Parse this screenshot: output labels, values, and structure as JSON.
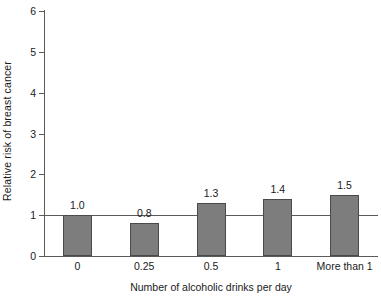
{
  "chart_data": {
    "type": "bar",
    "title": "",
    "subtitle": "",
    "xlabel": "Number of alcoholic drinks per day",
    "ylabel": "Relative risk of breast cancer",
    "categories": [
      "0",
      "0.25",
      "0.5",
      "1",
      "More than 1"
    ],
    "values": [
      1.0,
      0.8,
      1.3,
      1.4,
      1.5
    ],
    "value_labels": [
      "1.0",
      "0.8",
      "1.3",
      "1.4",
      "1.5"
    ],
    "ylim": [
      0,
      6
    ],
    "xlim_categories": 5,
    "y_ticks": [
      0,
      1,
      2,
      3,
      4,
      5,
      6
    ],
    "y_tick_labels": [
      "0",
      "1",
      "2",
      "3",
      "4",
      "5",
      "6"
    ],
    "grid": false,
    "legend": false,
    "legend_position": "none",
    "reference_line": {
      "axis": "y",
      "value": 1,
      "label": ""
    },
    "colors": {
      "bar_fill": "#7d7d7d",
      "bar_edge": "#4a4a4a",
      "axis": "#5a5a5a",
      "text": "#1a1a1a",
      "background": "#ffffff"
    },
    "annotations": []
  }
}
